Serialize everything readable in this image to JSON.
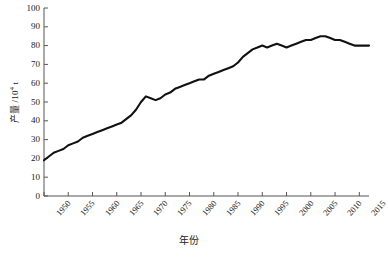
{
  "chart_data": {
    "type": "line",
    "title": "",
    "xlabel": "年份",
    "ylabel": "产量 /10⁴ t",
    "ylabel_main": "产量 /10",
    "ylabel_exp": "4",
    "ylabel_unit": " t",
    "xlim": [
      1950,
      2017
    ],
    "ylim": [
      0,
      100
    ],
    "grid": false,
    "legend": null,
    "line_color": "#111111",
    "axis_color": "#555555",
    "yticks": [
      0,
      10,
      20,
      30,
      40,
      50,
      60,
      70,
      80,
      90,
      100
    ],
    "xticks": [
      1950,
      1955,
      1960,
      1965,
      1970,
      1975,
      1980,
      1985,
      1990,
      1995,
      2000,
      2005,
      2010,
      2015
    ],
    "x": [
      1950,
      1951,
      1952,
      1953,
      1954,
      1955,
      1956,
      1957,
      1958,
      1959,
      1960,
      1961,
      1962,
      1963,
      1964,
      1965,
      1966,
      1967,
      1968,
      1969,
      1970,
      1971,
      1972,
      1973,
      1974,
      1975,
      1976,
      1977,
      1978,
      1979,
      1980,
      1981,
      1982,
      1983,
      1984,
      1985,
      1986,
      1987,
      1988,
      1989,
      1990,
      1991,
      1992,
      1993,
      1994,
      1995,
      1996,
      1997,
      1998,
      1999,
      2000,
      2001,
      2002,
      2003,
      2004,
      2005,
      2006,
      2007,
      2008,
      2009,
      2010,
      2011,
      2012,
      2013,
      2014,
      2015,
      2016,
      2017
    ],
    "values": [
      19,
      21,
      23,
      24,
      25,
      27,
      28,
      29,
      31,
      32,
      33,
      34,
      35,
      36,
      37,
      38,
      39,
      41,
      43,
      46,
      50,
      53,
      52,
      51,
      52,
      54,
      55,
      57,
      58,
      59,
      60,
      61,
      62,
      62,
      64,
      65,
      66,
      67,
      68,
      69,
      71,
      74,
      76,
      78,
      79,
      80,
      79,
      80,
      81,
      80,
      79,
      80,
      81,
      82,
      83,
      83,
      84,
      85,
      85,
      84,
      83,
      83,
      82,
      81,
      80,
      80,
      80,
      80
    ]
  },
  "axes": {
    "y_axis_name": "production-axis",
    "x_axis_name": "year-axis"
  }
}
